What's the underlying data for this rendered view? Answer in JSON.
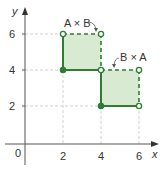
{
  "diagram": {
    "type": "cartesian-product-regions",
    "axes": {
      "x_label": "x",
      "y_label": "y",
      "origin_label": "0",
      "x_ticks": [
        "2",
        "4",
        "6"
      ],
      "y_ticks": [
        "2",
        "4",
        "6"
      ]
    },
    "regions": [
      {
        "label": "A × B",
        "x_range": [
          2,
          4
        ],
        "y_range": [
          4,
          6
        ],
        "solid_edges": [
          "left",
          "bottom"
        ],
        "dashed_edges": [
          "top",
          "right"
        ],
        "closed_corner": [
          2,
          4
        ],
        "open_corners": [
          [
            2,
            6
          ],
          [
            4,
            6
          ],
          [
            4,
            4
          ]
        ]
      },
      {
        "label": "B × A",
        "x_range": [
          4,
          6
        ],
        "y_range": [
          2,
          4
        ],
        "solid_edges": [
          "left",
          "bottom"
        ],
        "dashed_edges": [
          "top",
          "right"
        ],
        "closed_corner": [
          4,
          2
        ],
        "open_corners": [
          [
            4,
            4
          ],
          [
            6,
            4
          ],
          [
            6,
            2
          ]
        ]
      }
    ],
    "colors": {
      "fill": "#d9ead3",
      "stroke": "#2e7d32",
      "grid": "#bdbdbd",
      "axis": "#444444"
    }
  }
}
